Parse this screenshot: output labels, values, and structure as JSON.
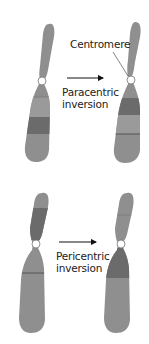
{
  "colors": {
    "chromosome_base": "#8f8f8f",
    "chromosome_dark_band": "#6b6b6b",
    "chromosome_light_band": "#a2a2a2",
    "band_line": "#555555",
    "centromere_fill": "#ffffff",
    "text": "#222222"
  },
  "labels": {
    "centromere": "Centromere",
    "paracentric_line1": "Paracentric",
    "paracentric_line2": "inversion",
    "pericentric_line1": "Pericentric",
    "pericentric_line2": "inversion"
  },
  "panels": [
    {
      "name": "paracentric-inversion",
      "before": "normal chromosome with dark band in lower arm",
      "after": "inverted segment within lower arm; centromere unchanged"
    },
    {
      "name": "pericentric-inversion",
      "before": "dark band in upper arm",
      "after": "dark band moved to lower arm; segment spans centromere"
    }
  ]
}
